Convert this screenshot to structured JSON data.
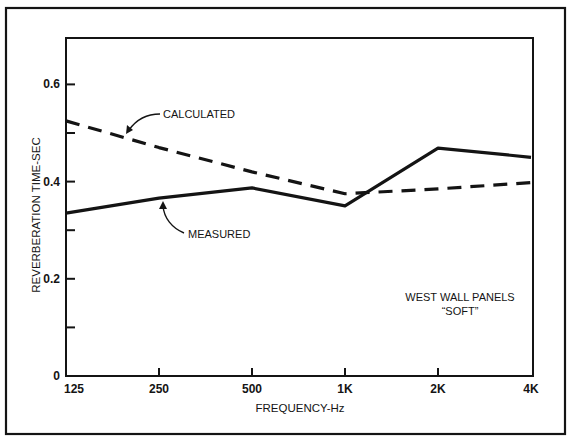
{
  "chart_data": {
    "type": "line",
    "title": "",
    "xlabel": "FREQUENCY-Hz",
    "ylabel": "REVERBERATION TIME-SEC",
    "categories": [
      "125",
      "250",
      "500",
      "1K",
      "2K",
      "4K"
    ],
    "x_scale": "log2 (octave bands)",
    "ylim": [
      0,
      0.7
    ],
    "y_ticks": [
      0,
      0.1,
      0.2,
      0.3,
      0.4,
      0.5,
      0.6
    ],
    "y_tick_labels": [
      "0",
      "",
      "0.2",
      "",
      "0.4",
      "",
      "0.6"
    ],
    "grid": false,
    "legend": "inline annotations with arrows",
    "series": [
      {
        "name": "CALCULATED",
        "style": "dashed",
        "values": [
          0.525,
          0.47,
          0.42,
          0.375,
          0.385,
          0.398
        ]
      },
      {
        "name": "MEASURED",
        "style": "solid",
        "values": [
          0.335,
          0.366,
          0.387,
          0.35,
          0.469,
          0.45
        ]
      }
    ],
    "annotations": [
      {
        "text": "CALCULATED",
        "points_to": "CALCULATED"
      },
      {
        "text": "MEASURED",
        "points_to": "MEASURED"
      },
      {
        "text": "WEST WALL PANELS",
        "position": "lower right"
      },
      {
        "text": "“SOFT”",
        "position": "lower right"
      }
    ]
  },
  "labels": {
    "xlabel": "FREQUENCY-Hz",
    "ylabel": "REVERBERATION TIME-SEC",
    "calculated": "CALCULATED",
    "measured": "MEASURED",
    "note_line1": "WEST WALL PANELS",
    "note_line2": "“SOFT”"
  },
  "colors": {
    "ink": "#141414",
    "paper": "#ffffff"
  }
}
